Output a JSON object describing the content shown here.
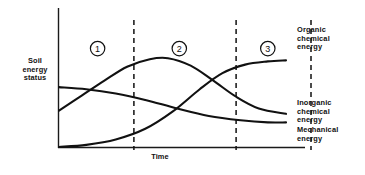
{
  "chart_data": {
    "type": "line",
    "title": "",
    "xlabel": "Time",
    "ylabel": "Soil energy status",
    "xlim": [
      0,
      100
    ],
    "ylim": [
      0,
      100
    ],
    "grid": false,
    "legend_position": "right-of-plot-at-line-ends",
    "axis_ticks": false,
    "phase_dividers": [
      {
        "label": "1",
        "x": 33
      },
      {
        "label": "2",
        "x": 78
      },
      {
        "label": "3",
        "x": 111
      }
    ],
    "phase_markers": [
      {
        "label": "1",
        "x": 17,
        "y": 92
      },
      {
        "label": "2",
        "x": 53,
        "y": 92
      },
      {
        "label": "3",
        "x": 92,
        "y": 92
      }
    ],
    "series": [
      {
        "name": "Organic chemical energy",
        "points": [
          {
            "x": 0,
            "y": 0
          },
          {
            "x": 12,
            "y": 2
          },
          {
            "x": 25,
            "y": 7
          },
          {
            "x": 38,
            "y": 17
          },
          {
            "x": 50,
            "y": 33
          },
          {
            "x": 62,
            "y": 54
          },
          {
            "x": 72,
            "y": 69
          },
          {
            "x": 82,
            "y": 77
          },
          {
            "x": 92,
            "y": 80
          },
          {
            "x": 100,
            "y": 81
          }
        ]
      },
      {
        "name": "Inorganic chemical energy",
        "points": [
          {
            "x": 0,
            "y": 34
          },
          {
            "x": 10,
            "y": 48
          },
          {
            "x": 20,
            "y": 62
          },
          {
            "x": 30,
            "y": 75
          },
          {
            "x": 40,
            "y": 82
          },
          {
            "x": 48,
            "y": 83
          },
          {
            "x": 58,
            "y": 76
          },
          {
            "x": 68,
            "y": 62
          },
          {
            "x": 78,
            "y": 47
          },
          {
            "x": 88,
            "y": 36
          },
          {
            "x": 100,
            "y": 31
          }
        ]
      },
      {
        "name": "Mechanical energy",
        "points": [
          {
            "x": 0,
            "y": 56
          },
          {
            "x": 12,
            "y": 54
          },
          {
            "x": 25,
            "y": 50
          },
          {
            "x": 38,
            "y": 44
          },
          {
            "x": 52,
            "y": 36
          },
          {
            "x": 66,
            "y": 29
          },
          {
            "x": 80,
            "y": 25
          },
          {
            "x": 92,
            "y": 23
          },
          {
            "x": 100,
            "y": 23
          }
        ]
      }
    ]
  },
  "labels": {
    "y_axis": "Soil\nenergy\nstatus",
    "x_axis": "Time",
    "organic": "Organic\nchemical\nenergy",
    "inorganic": "Inorganic\nchemical\nenergy",
    "mechanical": "Mechanical\nenergy"
  },
  "colors": {
    "curve": "#111111",
    "axis": "#1a1a1a",
    "background": "#ffffff"
  }
}
